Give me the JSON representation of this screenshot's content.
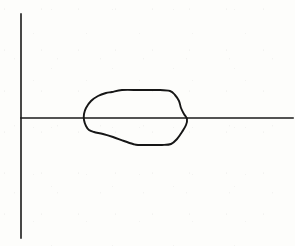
{
  "figure": {
    "background_color": "#fdfdfb",
    "ink_color": "#1a1a1a",
    "width": 295,
    "height": 246
  },
  "chart_data": {
    "type": "diagram",
    "title": "",
    "xlabel": "",
    "ylabel": "",
    "grid": false,
    "legend": null,
    "axes": {
      "vertical_axis": {
        "name": "vertical-axis",
        "x": 21,
        "y_top": 14,
        "y_bottom": 238
      },
      "horizontal_axis": {
        "name": "horizontal-axis",
        "y": 118,
        "x_left": 21,
        "x_right": 293
      },
      "origin": {
        "x": 21,
        "y": 118
      }
    },
    "region": {
      "name": "closed-region",
      "closed": true,
      "filled": false,
      "bounds": {
        "x_min": 84,
        "x_max": 188,
        "y_min": 90,
        "y_max": 146
      },
      "crosses_horizontal_axis": true,
      "points": [
        [
          112,
          92
        ],
        [
          122,
          90
        ],
        [
          140,
          90
        ],
        [
          158,
          90
        ],
        [
          170,
          91
        ],
        [
          175,
          95
        ],
        [
          179,
          101
        ],
        [
          181,
          108
        ],
        [
          184,
          114
        ],
        [
          187,
          119
        ],
        [
          186,
          125
        ],
        [
          182,
          132
        ],
        [
          177,
          139
        ],
        [
          171,
          144
        ],
        [
          162,
          145
        ],
        [
          150,
          145
        ],
        [
          138,
          145
        ],
        [
          133,
          144
        ],
        [
          124,
          141
        ],
        [
          113,
          137
        ],
        [
          103,
          134
        ],
        [
          94,
          132
        ],
        [
          89,
          130
        ],
        [
          86,
          126
        ],
        [
          84,
          120
        ],
        [
          84,
          114
        ],
        [
          86,
          108
        ],
        [
          91,
          101
        ],
        [
          98,
          96
        ],
        [
          106,
          93
        ]
      ]
    }
  }
}
